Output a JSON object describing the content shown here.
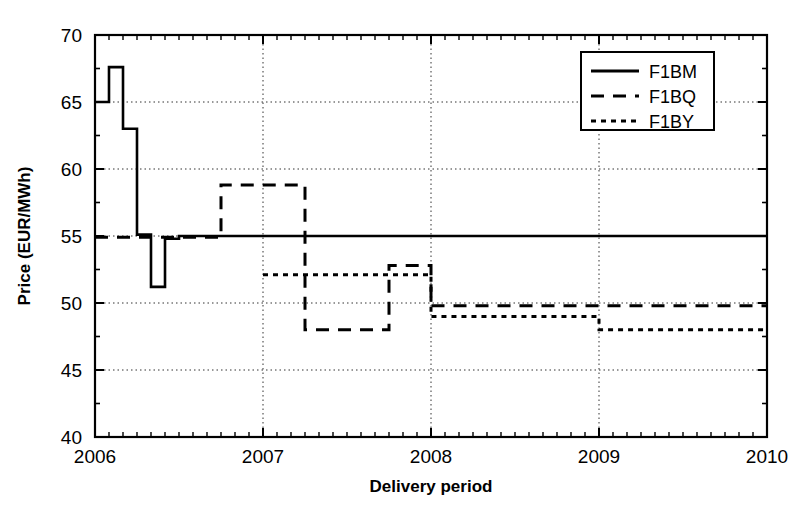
{
  "chart_data": {
    "type": "line",
    "title": "",
    "xlabel": "Delivery period",
    "ylabel": "Price (EUR/MWh)",
    "xlim": [
      2006,
      2010
    ],
    "ylim": [
      40,
      70
    ],
    "xticks": [
      "2006",
      "2007",
      "2008",
      "2009",
      "2010"
    ],
    "xtick_values": [
      2006,
      2007,
      2008,
      2009,
      2010
    ],
    "yticks": [
      "40",
      "45",
      "50",
      "55",
      "60",
      "65",
      "70"
    ],
    "ytick_values": [
      40,
      45,
      50,
      55,
      60,
      65,
      70
    ],
    "grid": true,
    "grid_style": "dotted",
    "minor_ticks": "monthly",
    "legend_position": "top-right",
    "line_color": "#000000",
    "series": [
      {
        "name": "F1BM",
        "style": "solid",
        "step": "post",
        "x": [
          2006.0,
          2006.0833,
          2006.1667,
          2006.25,
          2006.3333,
          2006.4167,
          2006.5,
          2006.5833,
          2006.6667
        ],
        "values": [
          65.0,
          67.6,
          63.0,
          55.1,
          51.2,
          54.8,
          55.0,
          55.0,
          55.0
        ]
      },
      {
        "name": "F1BQ",
        "style": "dashed",
        "step": "post",
        "x": [
          2006.0,
          2006.75,
          2007.25,
          2007.75,
          2008.0
        ],
        "values": [
          54.9,
          58.8,
          48.0,
          52.8,
          49.8
        ]
      },
      {
        "name": "F1BY",
        "style": "dotted",
        "step": "post",
        "x": [
          2007.0,
          2008.0,
          2009.0,
          2010.0
        ],
        "values": [
          52.1,
          49.0,
          48.0,
          48.0
        ]
      }
    ],
    "legend": [
      {
        "label": "F1BM",
        "style": "solid"
      },
      {
        "label": "F1BQ",
        "style": "dashed"
      },
      {
        "label": "F1BY",
        "style": "dotted"
      }
    ]
  }
}
